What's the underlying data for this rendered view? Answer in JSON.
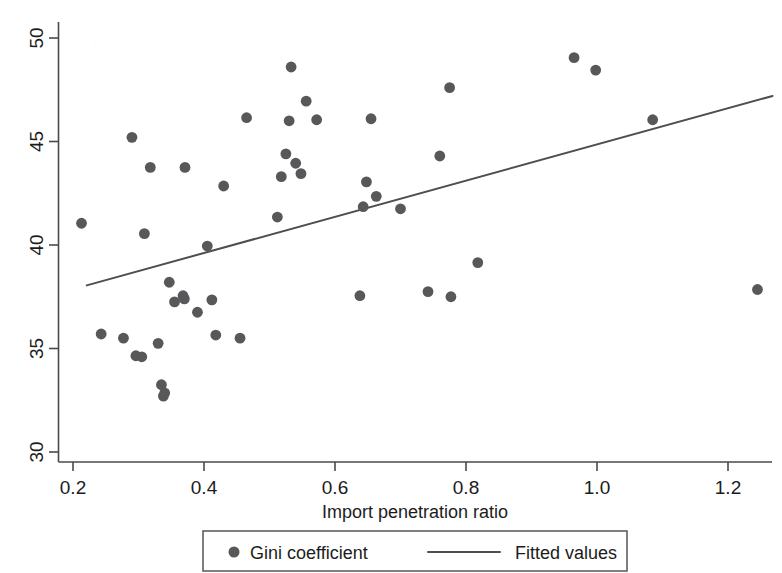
{
  "chart_data": {
    "type": "scatter",
    "title": "",
    "xlabel": "Import penetration ratio",
    "ylabel": "",
    "xlim": [
      0.175,
      1.27
    ],
    "ylim": [
      29.0,
      50.6
    ],
    "xticks": [
      0.2,
      0.4,
      0.6,
      0.8,
      1.0,
      1.2
    ],
    "xticklabels": [
      "0.2",
      "0.4",
      "0.6",
      "0.8",
      "1.0",
      "1.2"
    ],
    "yticks": [
      30,
      35,
      40,
      45,
      50
    ],
    "yticklabels": [
      "30",
      "35",
      "40",
      "45",
      "50"
    ],
    "grid": false,
    "legend_position": "bottom-center",
    "legend": [
      {
        "label": "Gini coefficient",
        "marker": "circle",
        "color": "#58585a"
      },
      {
        "label": "Fitted values",
        "marker": "line",
        "color": "#4e4e50"
      }
    ],
    "series": [
      {
        "name": "Gini coefficient",
        "marker": "circle",
        "color": "#58585a",
        "points": [
          [
            0.213,
            41.05
          ],
          [
            0.243,
            35.7
          ],
          [
            0.277,
            35.5
          ],
          [
            0.29,
            45.2
          ],
          [
            0.296,
            34.65
          ],
          [
            0.305,
            34.6
          ],
          [
            0.309,
            40.55
          ],
          [
            0.318,
            43.75
          ],
          [
            0.33,
            35.25
          ],
          [
            0.335,
            33.25
          ],
          [
            0.338,
            32.7
          ],
          [
            0.34,
            32.85
          ],
          [
            0.347,
            38.2
          ],
          [
            0.355,
            37.25
          ],
          [
            0.368,
            37.55
          ],
          [
            0.37,
            37.4
          ],
          [
            0.371,
            43.75
          ],
          [
            0.39,
            36.75
          ],
          [
            0.405,
            39.95
          ],
          [
            0.412,
            37.35
          ],
          [
            0.418,
            35.65
          ],
          [
            0.43,
            42.85
          ],
          [
            0.455,
            35.5
          ],
          [
            0.465,
            46.15
          ],
          [
            0.512,
            41.35
          ],
          [
            0.518,
            43.3
          ],
          [
            0.525,
            44.4
          ],
          [
            0.53,
            46.0
          ],
          [
            0.533,
            48.6
          ],
          [
            0.54,
            43.95
          ],
          [
            0.548,
            43.45
          ],
          [
            0.556,
            46.95
          ],
          [
            0.572,
            46.05
          ],
          [
            0.638,
            37.55
          ],
          [
            0.643,
            41.85
          ],
          [
            0.648,
            43.05
          ],
          [
            0.655,
            46.1
          ],
          [
            0.663,
            42.35
          ],
          [
            0.7,
            41.75
          ],
          [
            0.742,
            37.75
          ],
          [
            0.76,
            44.3
          ],
          [
            0.777,
            37.5
          ],
          [
            0.775,
            47.6
          ],
          [
            0.818,
            39.15
          ],
          [
            0.965,
            49.05
          ],
          [
            0.998,
            48.45
          ],
          [
            1.085,
            46.05
          ],
          [
            1.245,
            37.85
          ]
        ]
      },
      {
        "name": "Fitted values",
        "type": "line",
        "color": "#4e4e50",
        "endpoints": [
          [
            0.221,
            38.05
          ],
          [
            1.268,
            47.2
          ]
        ]
      }
    ]
  }
}
